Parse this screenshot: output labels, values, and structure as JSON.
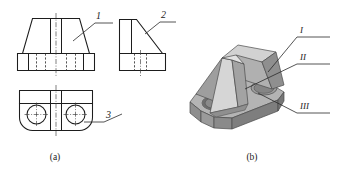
{
  "figure": {
    "captions": [
      {
        "id": "caption-a",
        "text": "(a)"
      },
      {
        "id": "caption-b",
        "text": "(b)"
      }
    ],
    "orthographic_view": {
      "name": "three-view-orthographic-projection",
      "views": [
        "front-view",
        "left-side-view",
        "top-view"
      ],
      "leader_labels": [
        {
          "id": "label-1",
          "text": "1",
          "target": "front-view-inclined-face"
        },
        {
          "id": "label-2",
          "text": "2",
          "target": "side-view-rib-diagonal"
        },
        {
          "id": "label-3",
          "text": "3",
          "target": "top-view-hole"
        }
      ]
    },
    "isometric_view": {
      "name": "isometric-solid-model",
      "leader_labels": [
        {
          "id": "label-I",
          "text": "I",
          "target": "trapezoidal-block-face"
        },
        {
          "id": "label-II",
          "text": "II",
          "target": "central-rib-face"
        },
        {
          "id": "label-III",
          "text": "III",
          "target": "base-plate-hole"
        }
      ]
    }
  },
  "colors": {
    "line": "#1d1d1d",
    "hidden": "#2a2a2a",
    "center": "#3a3a3a",
    "background": "#ffffff",
    "solid_top_light": "#cfcfcf",
    "solid_front_mid": "#a8a8a8",
    "solid_side_dark": "#8c8c8c",
    "solid_shadow": "#767676",
    "solid_highlight": "#dedede",
    "hole_dark": "#6e6e6e"
  }
}
